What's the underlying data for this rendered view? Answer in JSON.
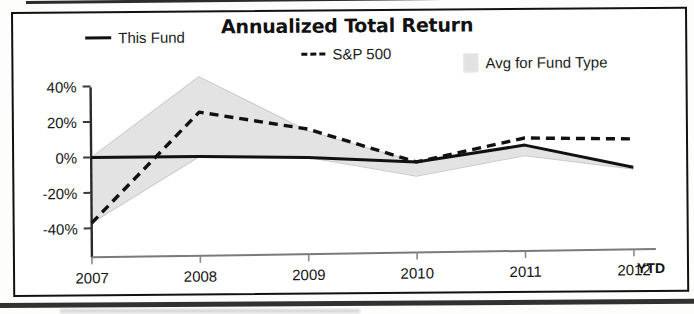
{
  "chart_data": {
    "type": "line",
    "title": "Annualized Total Return",
    "xlabel": "",
    "ylabel": "",
    "x": [
      "2007",
      "2008",
      "2009",
      "2010",
      "2011",
      "2012"
    ],
    "x_suffix_label": "YTD",
    "ytick_labels": [
      "40%",
      "20%",
      "0%",
      "-20%",
      "-40%"
    ],
    "ytick_values": [
      40,
      20,
      0,
      -20,
      -40
    ],
    "ylim": [
      -45,
      48
    ],
    "grid": false,
    "legend_position": "top",
    "series": [
      {
        "name": "This Fund",
        "style": "solid",
        "color": "#111111",
        "values": [
          0,
          0,
          -1,
          -4,
          5,
          -8
        ]
      },
      {
        "name": "S&P 500",
        "style": "dashed",
        "color": "#111111",
        "values": [
          -37,
          25,
          15,
          -4,
          9,
          8
        ]
      },
      {
        "name": "Avg for Fund Type",
        "style": "band",
        "color": "#e2e2e2",
        "band_upper": [
          0,
          45,
          14,
          -4,
          5,
          -8
        ],
        "band_lower": [
          -37,
          0,
          -1,
          -12,
          -1,
          -9
        ]
      }
    ],
    "annotations": []
  },
  "legend": {
    "items": [
      {
        "label": "This Fund",
        "icon": "solid-line-swatch"
      },
      {
        "label": "S&P 500",
        "icon": "dashed-line-swatch"
      },
      {
        "label": "Avg for Fund Type",
        "icon": "gray-box-swatch"
      }
    ]
  }
}
